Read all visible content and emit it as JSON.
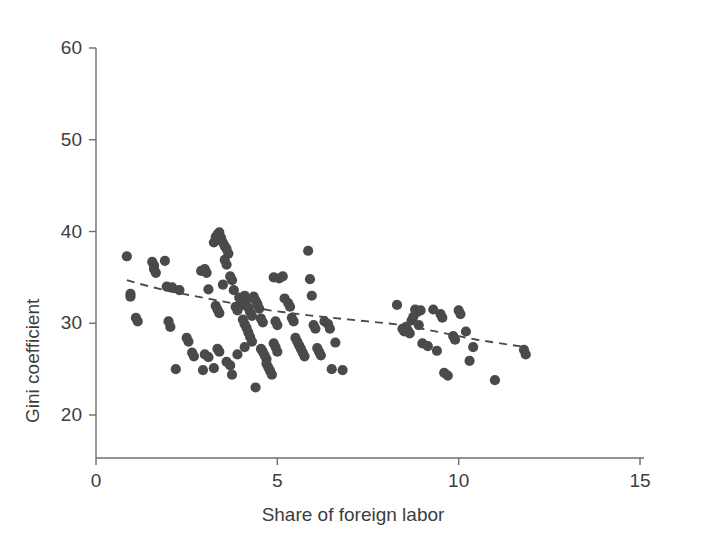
{
  "chart_data": {
    "type": "scatter",
    "title": "",
    "xlabel": "Share of foreign labor",
    "ylabel": "Gini coefficient",
    "xlim": [
      0,
      15
    ],
    "ylim": [
      18.5,
      62
    ],
    "xticks": [
      0,
      5,
      10,
      15
    ],
    "xtick_labels": [
      "0",
      "5",
      "10",
      "15"
    ],
    "yticks": [
      20,
      30,
      40,
      50,
      60
    ],
    "ytick_labels": [
      "20",
      "30",
      "40",
      "50",
      "60"
    ],
    "grid": false,
    "legend": null,
    "marker_color": "#4a4a4a",
    "marker_size": 6,
    "axis_color": "#6e6e6e",
    "trend": {
      "style": "dashed",
      "color": "#4a4a4a",
      "label": "",
      "points": [
        [
          0.85,
          34.7
        ],
        [
          1.2,
          34.3
        ],
        [
          1.6,
          33.9
        ],
        [
          2.0,
          33.5
        ],
        [
          2.4,
          33.2
        ],
        [
          2.8,
          32.9
        ],
        [
          3.2,
          32.6
        ],
        [
          3.6,
          32.3
        ],
        [
          4.0,
          32.0
        ],
        [
          4.4,
          31.7
        ],
        [
          4.8,
          31.4
        ],
        [
          5.2,
          31.2
        ],
        [
          5.6,
          31.0
        ],
        [
          6.0,
          30.8
        ],
        [
          6.5,
          30.6
        ],
        [
          7.0,
          30.4
        ],
        [
          7.5,
          30.2
        ],
        [
          8.0,
          30.0
        ],
        [
          8.5,
          29.8
        ],
        [
          9.0,
          29.4
        ],
        [
          9.5,
          29.0
        ],
        [
          10.0,
          28.6
        ],
        [
          10.5,
          28.2
        ],
        [
          11.0,
          27.9
        ],
        [
          11.5,
          27.6
        ],
        [
          11.85,
          27.4
        ]
      ]
    },
    "points": [
      [
        0.85,
        37.3
      ],
      [
        0.95,
        33.2
      ],
      [
        0.95,
        32.9
      ],
      [
        1.1,
        30.6
      ],
      [
        1.15,
        30.2
      ],
      [
        1.55,
        36.7
      ],
      [
        1.6,
        36.3
      ],
      [
        1.6,
        35.9
      ],
      [
        1.65,
        35.5
      ],
      [
        1.9,
        36.8
      ],
      [
        1.95,
        34.0
      ],
      [
        2.0,
        30.2
      ],
      [
        2.05,
        29.6
      ],
      [
        2.1,
        33.9
      ],
      [
        2.2,
        25.0
      ],
      [
        2.3,
        33.6
      ],
      [
        2.5,
        28.4
      ],
      [
        2.55,
        28.0
      ],
      [
        2.65,
        26.8
      ],
      [
        2.7,
        26.4
      ],
      [
        2.9,
        35.7
      ],
      [
        3.0,
        35.9
      ],
      [
        3.05,
        35.5
      ],
      [
        3.1,
        33.7
      ],
      [
        3.25,
        38.8
      ],
      [
        3.3,
        39.4
      ],
      [
        3.35,
        39.7
      ],
      [
        3.4,
        39.9
      ],
      [
        3.45,
        39.3
      ],
      [
        3.5,
        38.8
      ],
      [
        3.55,
        38.4
      ],
      [
        3.3,
        31.9
      ],
      [
        3.35,
        31.5
      ],
      [
        3.4,
        31.1
      ],
      [
        3.5,
        34.2
      ],
      [
        3.55,
        36.9
      ],
      [
        3.6,
        36.4
      ],
      [
        3.6,
        38.1
      ],
      [
        3.65,
        37.6
      ],
      [
        3.7,
        35.1
      ],
      [
        3.75,
        34.7
      ],
      [
        3.8,
        33.6
      ],
      [
        3.85,
        31.8
      ],
      [
        3.9,
        31.4
      ],
      [
        3.95,
        32.8
      ],
      [
        4.0,
        32.4
      ],
      [
        4.05,
        32.0
      ],
      [
        4.1,
        33.0
      ],
      [
        4.15,
        32.6
      ],
      [
        4.2,
        31.7
      ],
      [
        4.25,
        31.2
      ],
      [
        4.3,
        30.8
      ],
      [
        4.35,
        32.9
      ],
      [
        4.4,
        32.5
      ],
      [
        4.45,
        32.1
      ],
      [
        4.5,
        31.6
      ],
      [
        4.55,
        30.5
      ],
      [
        4.6,
        30.1
      ],
      [
        4.05,
        30.4
      ],
      [
        4.1,
        29.9
      ],
      [
        4.15,
        29.5
      ],
      [
        4.2,
        29.0
      ],
      [
        4.25,
        28.5
      ],
      [
        4.3,
        28.0
      ],
      [
        4.1,
        27.4
      ],
      [
        3.9,
        26.6
      ],
      [
        3.35,
        27.2
      ],
      [
        3.4,
        26.9
      ],
      [
        3.0,
        26.6
      ],
      [
        3.1,
        26.3
      ],
      [
        3.25,
        25.1
      ],
      [
        2.95,
        24.9
      ],
      [
        3.6,
        25.8
      ],
      [
        3.7,
        25.4
      ],
      [
        3.75,
        24.4
      ],
      [
        4.4,
        23.0
      ],
      [
        4.55,
        27.2
      ],
      [
        4.6,
        26.9
      ],
      [
        4.65,
        26.5
      ],
      [
        4.7,
        26.1
      ],
      [
        4.7,
        25.6
      ],
      [
        4.75,
        25.2
      ],
      [
        4.8,
        24.8
      ],
      [
        4.85,
        24.4
      ],
      [
        4.9,
        27.8
      ],
      [
        4.95,
        27.4
      ],
      [
        5.0,
        26.9
      ],
      [
        4.95,
        30.2
      ],
      [
        5.0,
        29.8
      ],
      [
        4.9,
        35.0
      ],
      [
        5.05,
        34.9
      ],
      [
        5.15,
        35.1
      ],
      [
        5.2,
        32.7
      ],
      [
        5.3,
        32.2
      ],
      [
        5.35,
        31.8
      ],
      [
        5.4,
        30.6
      ],
      [
        5.45,
        30.2
      ],
      [
        5.5,
        28.4
      ],
      [
        5.55,
        28.0
      ],
      [
        5.6,
        27.6
      ],
      [
        5.65,
        27.2
      ],
      [
        5.7,
        26.8
      ],
      [
        5.75,
        26.4
      ],
      [
        5.85,
        37.9
      ],
      [
        5.9,
        34.8
      ],
      [
        5.95,
        33.0
      ],
      [
        6.0,
        29.8
      ],
      [
        6.05,
        29.4
      ],
      [
        6.1,
        27.3
      ],
      [
        6.15,
        26.9
      ],
      [
        6.2,
        26.5
      ],
      [
        6.3,
        30.2
      ],
      [
        6.4,
        29.9
      ],
      [
        6.45,
        29.4
      ],
      [
        6.5,
        25.0
      ],
      [
        6.6,
        27.9
      ],
      [
        6.8,
        24.9
      ],
      [
        8.3,
        32.0
      ],
      [
        8.45,
        29.4
      ],
      [
        8.5,
        29.1
      ],
      [
        8.55,
        29.6
      ],
      [
        8.6,
        29.2
      ],
      [
        8.65,
        28.9
      ],
      [
        8.7,
        30.3
      ],
      [
        8.75,
        30.7
      ],
      [
        8.8,
        31.5
      ],
      [
        8.85,
        31.2
      ],
      [
        8.9,
        29.8
      ],
      [
        8.95,
        31.4
      ],
      [
        9.0,
        27.8
      ],
      [
        9.15,
        27.5
      ],
      [
        9.3,
        31.5
      ],
      [
        9.4,
        27.0
      ],
      [
        9.5,
        31.0
      ],
      [
        9.55,
        30.6
      ],
      [
        9.6,
        24.6
      ],
      [
        9.7,
        24.3
      ],
      [
        9.85,
        28.6
      ],
      [
        9.9,
        28.2
      ],
      [
        10.0,
        31.4
      ],
      [
        10.05,
        31.0
      ],
      [
        10.2,
        29.1
      ],
      [
        10.3,
        25.9
      ],
      [
        10.4,
        27.4
      ],
      [
        11.0,
        23.8
      ],
      [
        11.8,
        27.1
      ],
      [
        11.85,
        26.6
      ]
    ]
  },
  "figure": {
    "background": "#ffffff",
    "width": 706,
    "height": 545
  }
}
